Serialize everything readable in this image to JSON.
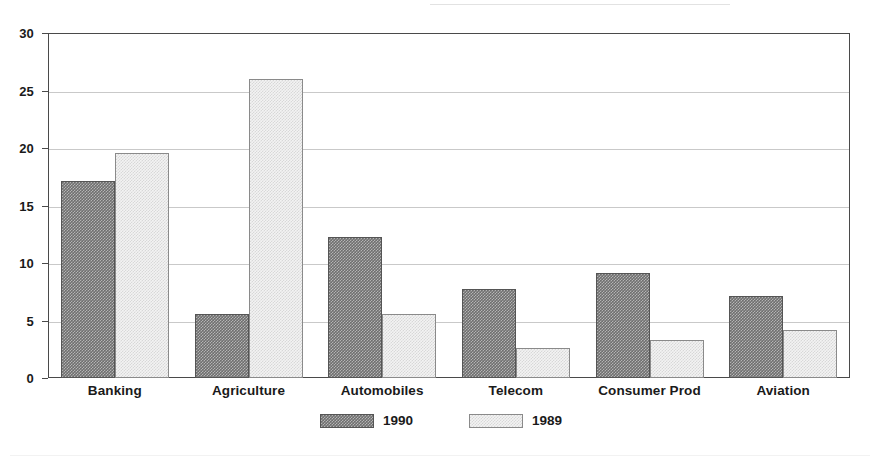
{
  "chart_data": {
    "type": "bar",
    "title": "",
    "subtitle": "",
    "xlabel": "",
    "ylabel": "",
    "categories": [
      "Banking",
      "Agriculture",
      "Automobiles",
      "Telecom",
      "Consumer Prod",
      "Aviation"
    ],
    "series": [
      {
        "name": "1990",
        "color": "#6f6f6f",
        "values": [
          17.1,
          5.6,
          12.3,
          7.7,
          9.1,
          7.1
        ]
      },
      {
        "name": "1989",
        "color": "#f3f3f3",
        "values": [
          19.6,
          26.0,
          5.6,
          2.6,
          3.3,
          4.2
        ]
      }
    ],
    "ylim": [
      0,
      30
    ],
    "yticks": [
      0,
      5,
      10,
      15,
      20,
      25,
      30
    ],
    "ytick_labels": [
      "0",
      "5",
      "10",
      "15",
      "20",
      "25",
      "30"
    ],
    "grid": true,
    "grid_axis": "y",
    "legend_position": "bottom-center",
    "legend_entries": [
      "1990",
      "1989"
    ],
    "bar_mode": "grouped",
    "frame": true,
    "frame_color": "#4a4a4a",
    "gridline_color": "#c9c9c9",
    "background_color": "#ffffff"
  }
}
